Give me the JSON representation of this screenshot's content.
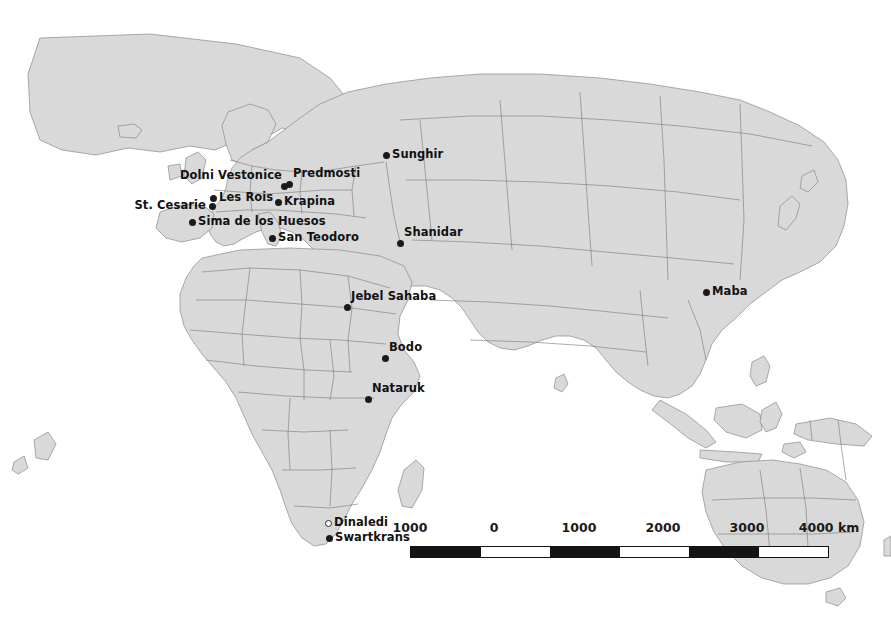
{
  "figure": {
    "background_color": "#ffffff",
    "land_color": "#d9d9d9",
    "border_color": "#7e7e7e",
    "marker_color": "#1a1a1a"
  },
  "sites": [
    {
      "name": "Sunghir",
      "label": "Sunghir",
      "x": 386,
      "y": 155,
      "placement": "right",
      "marker": "filled"
    },
    {
      "name": "Dolni Vestonice",
      "label": "Dolni Vestonice",
      "x": 284,
      "y": 186,
      "placement": "above-left",
      "marker": "filled"
    },
    {
      "name": "Predmosti",
      "label": "Predmosti",
      "x": 289,
      "y": 184,
      "placement": "above-right",
      "marker": "filled"
    },
    {
      "name": "Les Rois",
      "label": "Les Rois",
      "x": 213,
      "y": 198,
      "placement": "right",
      "marker": "filled"
    },
    {
      "name": "St. Cesarie",
      "label": "St. Cesarie",
      "x": 212,
      "y": 206,
      "placement": "left",
      "marker": "filled"
    },
    {
      "name": "Krapina",
      "label": "Krapina",
      "x": 278,
      "y": 202,
      "placement": "right",
      "marker": "filled"
    },
    {
      "name": "Sima de los Huesos",
      "label": "Sima de los Huesos",
      "x": 192,
      "y": 222,
      "placement": "right",
      "marker": "filled"
    },
    {
      "name": "San Teodoro",
      "label": "San Teodoro",
      "x": 272,
      "y": 238,
      "placement": "right",
      "marker": "filled"
    },
    {
      "name": "Shanidar",
      "label": "Shanidar",
      "x": 400,
      "y": 243,
      "placement": "above-right",
      "marker": "filled"
    },
    {
      "name": "Maba",
      "label": "Maba",
      "x": 706,
      "y": 292,
      "placement": "right",
      "marker": "filled"
    },
    {
      "name": "Jebel Sahaba",
      "label": "Jebel Sahaba",
      "x": 347,
      "y": 307,
      "placement": "above-right",
      "marker": "filled"
    },
    {
      "name": "Bodo",
      "label": "Bodo",
      "x": 385,
      "y": 358,
      "placement": "above-right",
      "marker": "filled"
    },
    {
      "name": "Nataruk",
      "label": "Nataruk",
      "x": 368,
      "y": 399,
      "placement": "above-right",
      "marker": "filled"
    },
    {
      "name": "Dinaledi",
      "label": "Dinaledi",
      "x": 328,
      "y": 523,
      "placement": "right",
      "marker": "hollow"
    },
    {
      "name": "Swartkrans",
      "label": "Swartkrans",
      "x": 329,
      "y": 538,
      "placement": "right",
      "marker": "filled"
    }
  ],
  "scale_bar": {
    "unit_label": "4000 km",
    "tick_labels": [
      "1000",
      "0",
      "1000",
      "2000",
      "3000",
      "4000 km"
    ],
    "tick_positions_px": [
      0,
      84,
      169,
      253,
      337,
      419
    ],
    "segments": [
      "fill",
      "empty",
      "fill",
      "empty",
      "fill",
      "empty"
    ],
    "segment_count": 6,
    "km_per_segment": 1000
  }
}
